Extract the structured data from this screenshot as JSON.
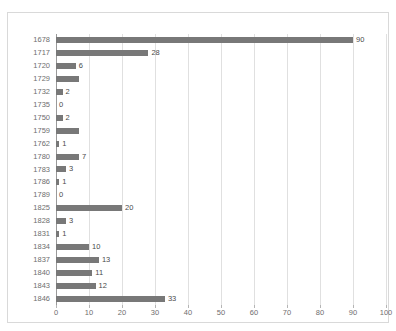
{
  "chart_data": {
    "type": "bar",
    "orientation": "horizontal",
    "title": "",
    "xlabel": "",
    "ylabel": "",
    "xlim": [
      0,
      100
    ],
    "xticks": [
      0,
      10,
      20,
      30,
      40,
      50,
      60,
      70,
      80,
      90,
      100
    ],
    "grid": true,
    "legend": false,
    "bar_color": "#787878",
    "categories": [
      "1678",
      "1717",
      "1720",
      "1729",
      "1732",
      "1735",
      "1750",
      "1759",
      "1762",
      "1780",
      "1783",
      "1786",
      "1789",
      "1825",
      "1828",
      "1831",
      "1834",
      "1837",
      "1840",
      "1843",
      "1846"
    ],
    "values": [
      90,
      28,
      6,
      7,
      2,
      0,
      2,
      7,
      1,
      7,
      3,
      1,
      0,
      20,
      3,
      1,
      10,
      13,
      11,
      12,
      33
    ],
    "data_labels": [
      "90",
      "28",
      "6",
      "",
      "2",
      "0",
      "2",
      "",
      "1",
      "7",
      "3",
      "1",
      "0",
      "20",
      "3",
      "1",
      "10",
      "13",
      "11",
      "12",
      "33"
    ]
  }
}
